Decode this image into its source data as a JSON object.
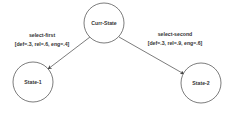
{
  "diagram": {
    "type": "state-transition",
    "nodes": [
      {
        "id": "curr",
        "label": "Curr-State",
        "cx": 104,
        "cy": 23,
        "r": 20
      },
      {
        "id": "s1",
        "label": "State-1",
        "cx": 33,
        "cy": 82,
        "r": 20
      },
      {
        "id": "s2",
        "label": "State-2",
        "cx": 201,
        "cy": 83,
        "r": 20
      }
    ],
    "edges": [
      {
        "from": "curr",
        "to": "s1",
        "action": "select-first",
        "params": "[def=.3, rel=.6, eng=.4]"
      },
      {
        "from": "curr",
        "to": "s2",
        "action": "select-second",
        "params": "[def=.3, rel=.9, eng=.6]"
      }
    ],
    "colors": {
      "stroke": "#444444",
      "text": "#333333",
      "background": "#ffffff"
    }
  }
}
